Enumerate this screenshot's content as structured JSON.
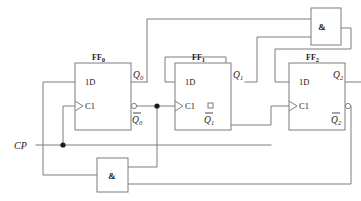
{
  "diagram": {
    "signals": {
      "clock_label": "CP"
    },
    "flipflops": [
      {
        "name": "FF",
        "index": "0",
        "data_pin": "1D",
        "clock_pin": "C1",
        "q_label": "Q",
        "q_index": "0",
        "qbar_label": "Q",
        "qbar_index": "0"
      },
      {
        "name": "FF",
        "index": "1",
        "data_pin": "1D",
        "clock_pin": "C1",
        "q_label": "Q",
        "q_index": "1",
        "qbar_label": "Q",
        "qbar_index": "1"
      },
      {
        "name": "FF",
        "index": "2",
        "data_pin": "1D",
        "clock_pin": "C1",
        "q_label": "Q",
        "q_index": "2",
        "qbar_label": "Q",
        "qbar_index": "2"
      }
    ],
    "gates": [
      {
        "id": "and-top",
        "symbol": "&",
        "inputs": 2
      },
      {
        "id": "and-bottom",
        "symbol": "&",
        "inputs": 2
      }
    ],
    "colors": {
      "wire": "#7d7d7d",
      "box_stroke": "#7d7d7d",
      "text": "#1a1a1a",
      "background": "#ffffff"
    }
  }
}
